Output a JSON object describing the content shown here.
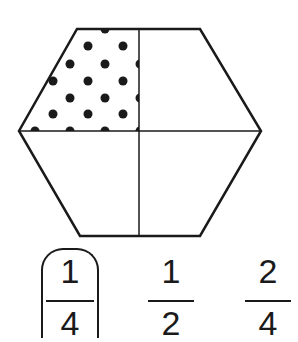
{
  "figure": {
    "shape": "hexagon",
    "divisions": 4,
    "shaded_parts": 1,
    "shaded_pattern": "dots",
    "colors": {
      "stroke": "#1a1a1a",
      "fill": "#ffffff",
      "dot": "#1a1a1a"
    }
  },
  "answers": [
    {
      "numerator": "1",
      "denominator": "4",
      "selected": true
    },
    {
      "numerator": "1",
      "denominator": "2",
      "selected": false
    },
    {
      "numerator": "2",
      "denominator": "4",
      "selected": false
    }
  ]
}
